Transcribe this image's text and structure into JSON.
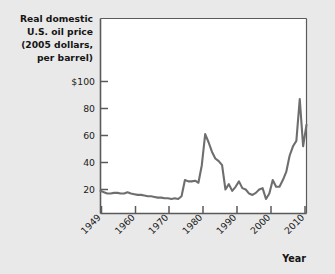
{
  "figure": {
    "background_color": "#e9e9e9",
    "plot_background_color": "#ffffff",
    "axis_color": "#5a5a5a",
    "line_color": "#6e6e6e"
  },
  "chart_data": {
    "type": "line",
    "title": "Real domestic U.S. oil price (2005 dollars, per barrel)",
    "title_lines": [
      "Real domestic",
      "U.S. oil price",
      "(2005 dollars,",
      "per barrel)"
    ],
    "xlabel": "Year",
    "ylabel": "Real domestic U.S. oil price (2005 dollars, per barrel)",
    "grid": false,
    "legend": null,
    "xlim": [
      1949,
      2010
    ],
    "ylim": [
      0,
      110
    ],
    "xticks": [
      1949,
      1960,
      1970,
      1980,
      1990,
      2000,
      2010
    ],
    "xtick_labels": [
      "1949",
      "1960",
      "1970",
      "1980",
      "1990",
      "2000",
      "2010"
    ],
    "yticks": [
      20,
      40,
      60,
      80,
      100
    ],
    "ytick_labels": [
      "20",
      "40",
      "60",
      "80",
      "$100"
    ],
    "series": [
      {
        "name": "Real domestic U.S. oil price",
        "x": [
          1949,
          1950,
          1951,
          1952,
          1953,
          1954,
          1955,
          1956,
          1957,
          1958,
          1959,
          1960,
          1961,
          1962,
          1963,
          1964,
          1965,
          1966,
          1967,
          1968,
          1969,
          1970,
          1971,
          1972,
          1973,
          1974,
          1975,
          1976,
          1977,
          1978,
          1979,
          1980,
          1981,
          1982,
          1983,
          1984,
          1985,
          1986,
          1987,
          1988,
          1989,
          1990,
          1991,
          1992,
          1993,
          1994,
          1995,
          1996,
          1997,
          1998,
          1999,
          2000,
          2001,
          2002,
          2003,
          2004,
          2005,
          2006,
          2007,
          2008,
          2009,
          2010
        ],
        "values": [
          19.0,
          18.0,
          17.0,
          17.0,
          17.5,
          17.5,
          17.0,
          17.0,
          18.0,
          17.0,
          16.5,
          16.0,
          16.0,
          15.5,
          15.0,
          15.0,
          14.5,
          14.0,
          14.0,
          13.5,
          13.5,
          13.0,
          13.5,
          13.0,
          15.0,
          27.0,
          26.0,
          26.0,
          26.5,
          25.0,
          38.0,
          61.0,
          55.0,
          48.0,
          43.0,
          41.0,
          38.0,
          20.0,
          24.0,
          19.0,
          22.0,
          26.0,
          21.0,
          20.0,
          17.0,
          16.0,
          17.5,
          20.0,
          21.0,
          13.0,
          17.0,
          27.0,
          22.0,
          22.0,
          27.0,
          33.0,
          45.0,
          52.0,
          56.0,
          87.0,
          52.0,
          68.0
        ]
      }
    ]
  }
}
